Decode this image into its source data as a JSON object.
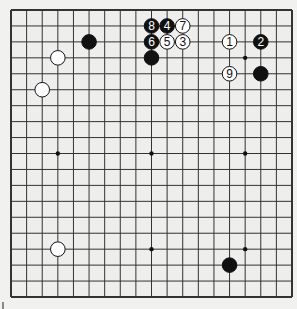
{
  "diagram": {
    "type": "go-board",
    "size": 19,
    "colors": {
      "background": "#f1f1ef",
      "board": "#eeeeec",
      "line": "#333333",
      "black": "#111111",
      "white": "#ffffff"
    },
    "geometry": {
      "left": 11,
      "top": 10,
      "right": 292,
      "bottom": 297
    },
    "star_points": [
      [
        3,
        3
      ],
      [
        3,
        9
      ],
      [
        3,
        15
      ],
      [
        9,
        3
      ],
      [
        9,
        9
      ],
      [
        9,
        15
      ],
      [
        15,
        3
      ],
      [
        15,
        9
      ],
      [
        15,
        15
      ]
    ],
    "stones": [
      {
        "col": 5,
        "row": 2,
        "color": "black",
        "label": ""
      },
      {
        "col": 3,
        "row": 3,
        "color": "white",
        "label": ""
      },
      {
        "col": 2,
        "row": 5,
        "color": "white",
        "label": ""
      },
      {
        "col": 9,
        "row": 3,
        "color": "black",
        "label": ""
      },
      {
        "col": 16,
        "row": 4,
        "color": "black",
        "label": ""
      },
      {
        "col": 3,
        "row": 15,
        "color": "white",
        "label": ""
      },
      {
        "col": 14,
        "row": 16,
        "color": "black",
        "label": ""
      },
      {
        "col": 14,
        "row": 2,
        "color": "white",
        "label": "1"
      },
      {
        "col": 16,
        "row": 2,
        "color": "black",
        "label": "2"
      },
      {
        "col": 11,
        "row": 2,
        "color": "white",
        "label": "3"
      },
      {
        "col": 10,
        "row": 1,
        "color": "black",
        "label": "4"
      },
      {
        "col": 10,
        "row": 2,
        "color": "white",
        "label": "5"
      },
      {
        "col": 9,
        "row": 2,
        "color": "black",
        "label": "6"
      },
      {
        "col": 11,
        "row": 1,
        "color": "white",
        "label": "7"
      },
      {
        "col": 9,
        "row": 1,
        "color": "black",
        "label": "8"
      },
      {
        "col": 14,
        "row": 4,
        "color": "white",
        "label": "9"
      }
    ]
  }
}
